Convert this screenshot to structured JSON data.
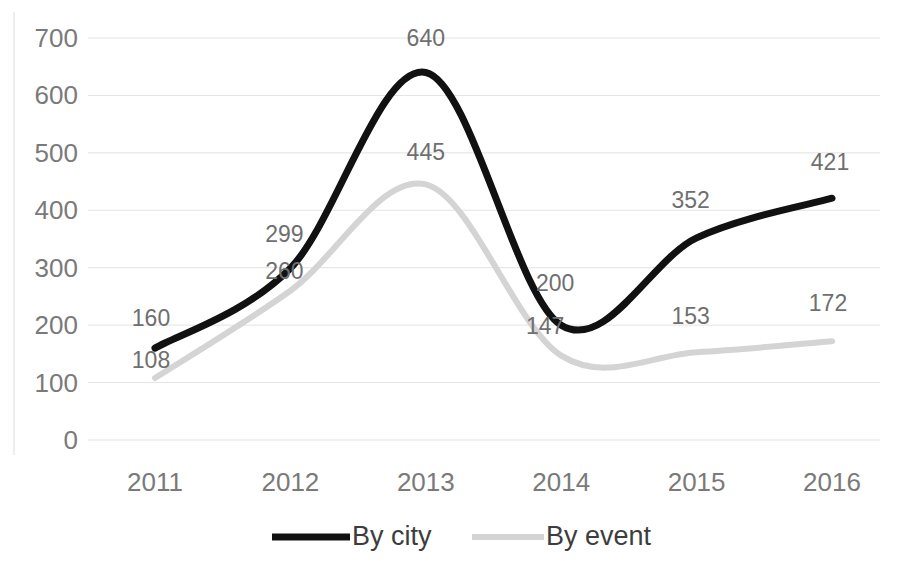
{
  "chart_data": {
    "type": "line",
    "title": "",
    "subtitle": "",
    "xlabel": "",
    "ylabel": "",
    "categories": [
      "2011",
      "2012",
      "2013",
      "2014",
      "2015",
      "2016"
    ],
    "x": [
      2011,
      2012,
      2013,
      2014,
      2015,
      2016
    ],
    "series": [
      {
        "name": "By city",
        "color": "#111111",
        "values": [
          160,
          299,
          640,
          200,
          352,
          421
        ],
        "labels": [
          "160",
          "299",
          "640",
          "200",
          "352",
          "421"
        ],
        "smooth": true
      },
      {
        "name": "By event",
        "color": "#d4d4d4",
        "values": [
          108,
          260,
          445,
          147,
          153,
          172
        ],
        "labels": [
          "108",
          "260",
          "445",
          "147",
          "153",
          "172"
        ],
        "smooth": true
      }
    ],
    "ylim": [
      0,
      700
    ],
    "yticks": [
      0,
      100,
      200,
      300,
      400,
      500,
      600,
      700
    ],
    "ytick_labels": [
      "0",
      "100",
      "200",
      "300",
      "400",
      "500",
      "600",
      "700"
    ],
    "xtick_labels": [
      "2011",
      "2012",
      "2013",
      "2014",
      "2015",
      "2016"
    ],
    "grid": true,
    "grid_axis": "y",
    "grid_color": "#e3e3e3",
    "legend": {
      "position": "bottom",
      "entries": [
        {
          "label": "By city",
          "color": "#111111",
          "marker": "line-solid-thick"
        },
        {
          "label": "By event",
          "color": "#d4d4d4",
          "marker": "line-solid-thin"
        }
      ]
    },
    "data_labels_shown": true,
    "background_color": "#ffffff",
    "axis_label_color": "#7a7a7a"
  }
}
